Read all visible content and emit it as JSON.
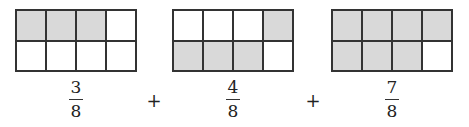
{
  "figures": [
    {
      "numerator": "3",
      "denominator": "8",
      "cells": [
        1,
        1,
        1,
        0,
        0,
        0,
        0,
        0
      ]
    },
    {
      "numerator": "4",
      "denominator": "8",
      "cells": [
        0,
        0,
        0,
        1,
        1,
        1,
        1,
        0
      ]
    },
    {
      "numerator": "7",
      "denominator": "8",
      "cells": [
        1,
        1,
        1,
        1,
        1,
        1,
        1,
        0
      ]
    }
  ],
  "operators": [
    "+",
    "+"
  ],
  "colors": {
    "shaded": "#d9d9d9",
    "line": "#333333"
  }
}
